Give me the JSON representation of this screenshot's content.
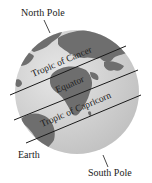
{
  "diagram": {
    "labels": {
      "north_pole": "North Pole",
      "south_pole": "South Pole",
      "earth": "Earth",
      "tropic_of_cancer": "Tropic of Cancer",
      "equator": "Equator",
      "tropic_of_capricorn": "Tropic of Capricorn"
    },
    "colors": {
      "ocean": "#d4d4d4",
      "land": "#6e6e6e",
      "line": "#1a1a1a",
      "text": "#222222"
    }
  }
}
